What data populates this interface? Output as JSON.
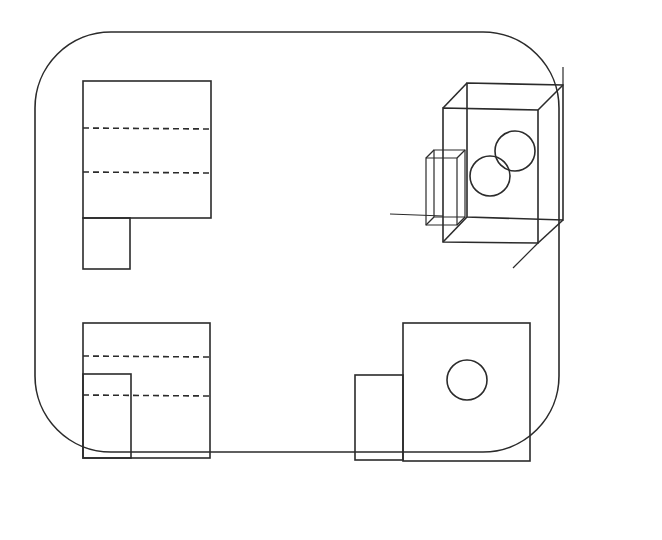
{
  "figure": {
    "type": "engineering-drawing",
    "stroke_color": "#2b2b2b",
    "background": "#ffffff"
  },
  "frame": {
    "x": 35,
    "y": 32,
    "width": 262,
    "height": 210,
    "corner_radius": 38
  },
  "views": [
    {
      "name": "top-view",
      "position": "upper-left",
      "hidden_lines": 2
    },
    {
      "name": "isometric-view",
      "position": "upper-right",
      "circles": 2
    },
    {
      "name": "front-view",
      "position": "lower-left",
      "hidden_lines": 2
    },
    {
      "name": "side-view",
      "position": "lower-right",
      "circles": 1
    }
  ]
}
